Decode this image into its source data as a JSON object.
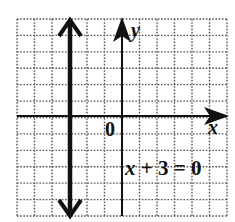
{
  "chart_data": {
    "type": "line",
    "title": "",
    "xlabel": "x",
    "ylabel": "y",
    "origin_label": "0",
    "xlim": [
      -6,
      6
    ],
    "ylim": [
      -6,
      6
    ],
    "grid": true,
    "grid_style": "dotted",
    "series": [
      {
        "name": "x + 3 = 0",
        "kind": "vertical-line",
        "x": -3,
        "points": [
          [
            -3,
            -6
          ],
          [
            -3,
            6
          ]
        ],
        "arrows": "both",
        "color": "#111111"
      }
    ],
    "annotations": [
      {
        "text": "x + 3 = 0",
        "position": [
          0.2,
          -3
        ]
      }
    ]
  },
  "labels": {
    "x_axis": "x",
    "y_axis": "y",
    "origin": "0",
    "equation_lhs_var": "x",
    "equation_rest": " + 3 = 0"
  },
  "colors": {
    "ink": "#111111",
    "grid": "#555555",
    "background": "#ffffff"
  }
}
